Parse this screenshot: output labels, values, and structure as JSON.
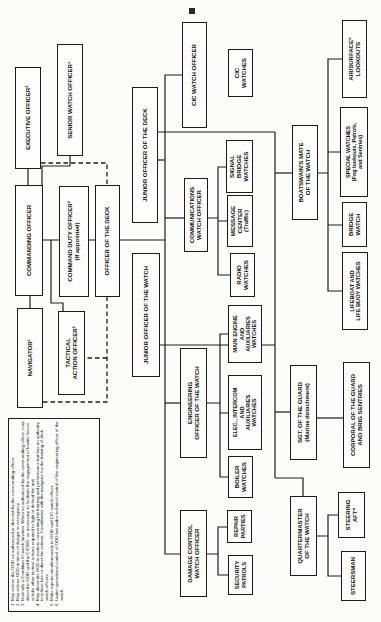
{
  "nodes": {
    "navigator": {
      "label": "NAVIGATOR¹"
    },
    "commanding_officer": {
      "label": "COMMANDING OFFICER"
    },
    "executive_officer": {
      "label": "EXECUTIVE OFFICER²"
    },
    "tactical_action_officer": {
      "label": "TACTICAL\nACTION OFFICER³"
    },
    "command_duty_officer": {
      "label": "COMMAND DUTY OFFICER²\n(If appointed)"
    },
    "senior_watch_officer": {
      "label": "SENIOR WATCH OFFICER⁴"
    },
    "officer_of_the_deck": {
      "label": "OFFICER OF THE DECK"
    },
    "junior_officer_of_the_watch": {
      "label": "JUNIOR OFFICER OF THE WATCH"
    },
    "junior_officer_of_the_deck": {
      "label": "JUNIOR OFFICER OF THE DECK"
    },
    "cic_watch_officer": {
      "label": "CIC WATCH OFFICER"
    },
    "cic_watches": {
      "label": "CIC\nWATCHES"
    },
    "communications_watch_officer": {
      "label": "COMMUNICATIONS\nWATCH OFFICER"
    },
    "signal_bridge_watches": {
      "label": "SIGNAL\nBRIDGE\nWATCHES"
    },
    "message_center": {
      "label": "MESSAGE\nCENTER\n(Traffic)"
    },
    "radio_watches": {
      "label": "RADIO\nWATCHES"
    },
    "engineering_officer_of_the_watch": {
      "label": "ENGINEERING\nOFFICER OF THE WATCH"
    },
    "main_engine_watches": {
      "label": "MAIN ENGINE\nAND\nAUXILIARIES\nWATCHES"
    },
    "elec_intercom_watches": {
      "label": "ELEC., INTERCOM\nAND\nAUXILIARIES\nWATCHES"
    },
    "boiler_watches": {
      "label": "BOILER\nWATCHES"
    },
    "damage_control_watch_officer": {
      "label": "DAMAGE CONTROL\nWATCH OFFICER"
    },
    "repair_parties": {
      "label": "REPAIR\nPARTIES"
    },
    "security_patrols": {
      "label": "SECURITY\nPATROLS"
    },
    "boatswains_mate_of_the_watch": {
      "label": "BOATSWAIN'S MATE\nOF THE WATCH"
    },
    "air_surface_lookouts": {
      "label": "AIR/SURFACE⁵\nLOOKOUTS"
    },
    "special_watches": {
      "label": "SPECIAL WATCHES\n(Fog lookouts, Patrols,\nand Sentries)"
    },
    "bridge_watch": {
      "label": "BRIDGE\nWATCH"
    },
    "lifeboat_watches": {
      "label": "LIFEBOAT AND\nLIFE BUOY WATCHES"
    },
    "sgt_of_the_guard": {
      "label": "SGT. OF THE GUARD\n(Marine detachment)"
    },
    "corporal_of_the_guard": {
      "label": "CORPORAL OF THE GUARD\nAND BRIG SENTRIES"
    },
    "quartermaster_of_the_watch": {
      "label": "QUARTERMASTER\nOF THE WATCH"
    },
    "steering_aft": {
      "label": "STEERING\nAFT⁶"
    },
    "steersman": {
      "label": "STEERSMAN"
    }
  },
  "footnotes": {
    "items": [
      "May relieve the OOD as authorized or directed by the commanding officer.",
      "May relieve OOD in times of danger or emergency.",
      "Normally a Condition III watch function. When so authorized by the commanding officer, may direct the OOD and the CICWO, as necessary, to facilitate the engagement of hostile forces or take other tactical actions required to fight or defend the unit.",
      "May direct the OOD in matters concerning his training and performance but has no authority to relieve him or direct his actions. Coordinates with the navigator for the training of deck watch officers.",
      "Make reports simultaneously to OOD and CIC watch officer.",
      "Under operational control of OOD but under technical control of the engineering officer of the watch."
    ]
  }
}
